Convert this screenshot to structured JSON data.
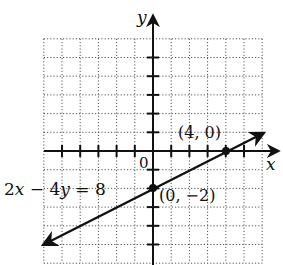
{
  "chart_data": {
    "type": "line",
    "title": "",
    "xlabel": "x",
    "ylabel": "y",
    "xlim": [
      -6,
      6
    ],
    "ylim": [
      -6,
      6
    ],
    "grid": true,
    "grid_style": "dotted",
    "origin_label": "0",
    "tick_spacing": 1,
    "series": [
      {
        "name": "2x − 4y = 8",
        "equation": "2x − 4y = 8",
        "slope": 0.5,
        "intercept": -2,
        "x": [
          -6,
          6
        ],
        "y": [
          -5,
          1
        ],
        "arrows": "both"
      }
    ],
    "points": [
      {
        "x": 4,
        "y": 0,
        "label": "(4, 0)"
      },
      {
        "x": 0,
        "y": -2,
        "label": "(0, −2)"
      }
    ],
    "annotations": [
      {
        "text": "2x − 4y = 8",
        "position": "left of (0, −2)"
      }
    ]
  },
  "labels": {
    "x_axis": "x",
    "y_axis": "y",
    "origin": "0",
    "equation_2x": "2",
    "equation_x": "x",
    "equation_minus": " − 4",
    "equation_y": "y",
    "equation_rhs": " = 8",
    "point_a": "(4, 0)",
    "point_b": "(0, −2)"
  },
  "colors": {
    "ink": "#111111",
    "grid": "#555555",
    "background": "#ffffff"
  }
}
